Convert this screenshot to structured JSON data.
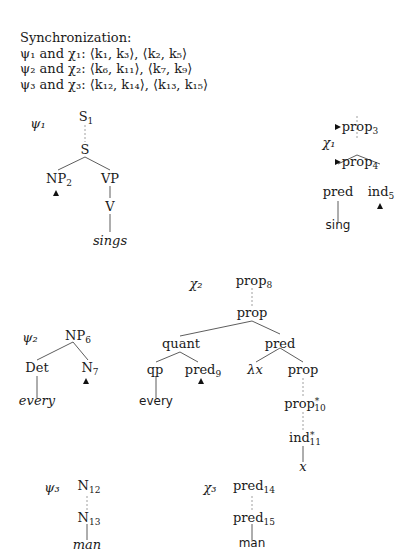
{
  "synchronization": {
    "header": "Synchronization:",
    "rows": [
      "ψ₁ and χ₁: ⟨k₁, k₃⟩, ⟨k₂, k₅⟩",
      "ψ₂ and χ₂: ⟨k₆, k₁₁⟩, ⟨k₇, k₉⟩",
      "ψ₃ and χ₃: ⟨k₁₂, k₁₄⟩, ⟨k₁₃, k₁₅⟩"
    ]
  },
  "trees": {
    "psi1": {
      "name": "ψ₁",
      "nodes": {
        "S1": "S",
        "S1_sub": "1",
        "S": "S",
        "NP2": "NP",
        "NP2_sub": "2",
        "VP": "VP",
        "V": "V",
        "sings": "sings"
      }
    },
    "chi1": {
      "name": "χ₁",
      "nodes": {
        "prop3": "prop",
        "prop3_sub": "3",
        "prop4": "prop",
        "prop4_sub": "4",
        "pred": "pred",
        "ind5": "ind",
        "ind5_sub": "5",
        "sing": "sing"
      }
    },
    "psi2": {
      "name": "ψ₂",
      "nodes": {
        "NP6": "NP",
        "NP6_sub": "6",
        "Det": "Det",
        "N7": "N",
        "N7_sub": "7",
        "every": "every"
      }
    },
    "chi2": {
      "name": "χ₂",
      "nodes": {
        "prop8": "prop",
        "prop8_sub": "8",
        "prop": "prop",
        "quant": "quant",
        "pred": "pred",
        "qp": "qp",
        "pred9": "pred",
        "pred9_sub": "9",
        "lambda": "λx",
        "prop_r": "prop",
        "prop10": "prop",
        "prop10_sub": "10",
        "ind11": "ind",
        "ind11_sub": "11",
        "star": "*",
        "x": "x",
        "every": "every"
      }
    },
    "psi3": {
      "name": "ψ₃",
      "nodes": {
        "N12": "N",
        "N12_sub": "12",
        "N13": "N",
        "N13_sub": "13",
        "man": "man"
      }
    },
    "chi3": {
      "name": "χ₃",
      "nodes": {
        "pred14": "pred",
        "pred14_sub": "14",
        "pred15": "pred",
        "pred15_sub": "15",
        "man": "man"
      }
    }
  }
}
